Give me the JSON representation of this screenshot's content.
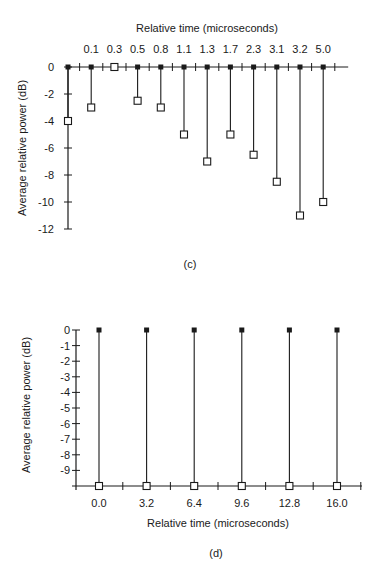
{
  "chart_data": [
    {
      "id": "c",
      "type": "stem",
      "caption": "(c)",
      "title": "",
      "xlabel": "Relative time (microseconds)",
      "xlabel_position": "top",
      "ylabel": "Average relative power (dB)",
      "ylim": [
        -12,
        0
      ],
      "yticks": [
        0,
        -2,
        -4,
        -6,
        -8,
        -10,
        -12
      ],
      "categories": [
        "0.0",
        "0.1",
        "0.3",
        "0.5",
        "0.8",
        "1.1",
        "1.3",
        "1.7",
        "2.3",
        "3.1",
        "3.2",
        "5.0"
      ],
      "tick_labels_shown": [
        "0.1",
        "0.3",
        "0.5",
        "0.8",
        "1.1",
        "1.3",
        "1.7",
        "2.3",
        "3.1",
        "3.2",
        "5.0"
      ],
      "values": [
        -4,
        -3,
        0,
        -2.5,
        -3,
        -5,
        -7,
        -5,
        -6.5,
        -8.5,
        -11,
        -10
      ],
      "grid": false,
      "marker_top": "filled-square",
      "marker_value": "open-square"
    },
    {
      "id": "d",
      "type": "stem",
      "caption": "(d)",
      "title": "",
      "xlabel": "Relative time (microseconds)",
      "xlabel_position": "bottom",
      "ylabel": "Average relative power (dB)",
      "ylim": [
        -10,
        0
      ],
      "yticks": [
        0,
        -1,
        -2,
        -3,
        -4,
        -5,
        -6,
        -7,
        -8,
        -9
      ],
      "categories": [
        "0.0",
        "3.2",
        "6.4",
        "9.6",
        "12.8",
        "16.0"
      ],
      "values": [
        0,
        0,
        0,
        0,
        0,
        0
      ],
      "grid": false,
      "marker_top": "filled-square",
      "marker_value": "open-square",
      "note": "stems extend from 0 dB down to the baseline with open squares on the x-axis"
    }
  ]
}
